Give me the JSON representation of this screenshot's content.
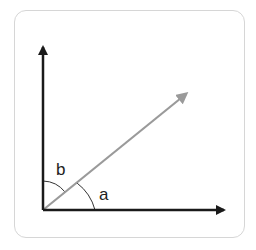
{
  "diagram": {
    "title": "",
    "labels": {
      "angle_a": "a",
      "angle_b": "b"
    },
    "colors": {
      "axis": "#1a1a1a",
      "vector": "#9a9a9a",
      "arc": "#333333",
      "frame": "#d6d6d6"
    },
    "elements": [
      {
        "type": "axis",
        "name": "x-axis",
        "from": [
          43,
          210
        ],
        "to": [
          229,
          210
        ]
      },
      {
        "type": "axis",
        "name": "y-axis",
        "from": [
          43,
          210
        ],
        "to": [
          43,
          42
        ]
      },
      {
        "type": "vector",
        "name": "diagonal-vector",
        "from": [
          43,
          210
        ],
        "to": [
          191,
          90
        ]
      },
      {
        "type": "angle-arc",
        "name": "angle-a",
        "between": [
          "x-axis",
          "diagonal-vector"
        ]
      },
      {
        "type": "angle-arc",
        "name": "angle-b",
        "between": [
          "diagonal-vector",
          "y-axis"
        ]
      }
    ]
  }
}
